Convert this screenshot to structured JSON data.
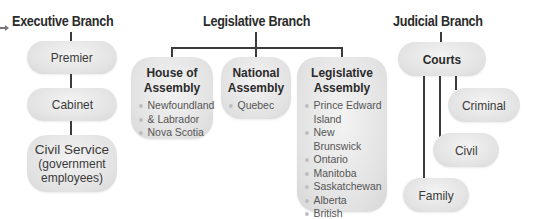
{
  "executive": {
    "title": "Executive Branch",
    "nodes": [
      "Premier",
      "Cabinet"
    ],
    "civil_service": {
      "title": "Civil Service",
      "subtitle_1": "(government",
      "subtitle_2": "employees)"
    }
  },
  "legislative": {
    "title": "Legislative Branch",
    "bodies": [
      {
        "title_1": "House of",
        "title_2": "Assembly",
        "items": [
          "Newfoundland",
          "& Labrador",
          "Nova Scotia"
        ]
      },
      {
        "title_1": "National",
        "title_2": "Assembly",
        "items": [
          "Quebec"
        ]
      },
      {
        "title_1": "Legislative",
        "title_2": "Assembly",
        "items": [
          "Prince Edward",
          "Island",
          "New Brunswick",
          "Ontario",
          "Manitoba",
          "Saskatchewan",
          "Alberta",
          "British Columbia"
        ]
      }
    ]
  },
  "judicial": {
    "title": "Judicial Branch",
    "root": "Courts",
    "children": [
      "Criminal",
      "Civil",
      "Family"
    ]
  }
}
